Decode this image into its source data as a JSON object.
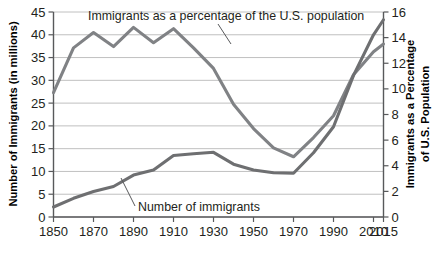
{
  "chart_data": {
    "type": "line",
    "title": "",
    "xlabel": "",
    "ylabel": "Number of Immigrants (in millions)",
    "y2label": "Immigrants as a Percentage of U.S. Population",
    "x": [
      1850,
      1860,
      1870,
      1880,
      1890,
      1900,
      1910,
      1920,
      1930,
      1940,
      1950,
      1960,
      1970,
      1980,
      1990,
      2000,
      2010,
      2015
    ],
    "xticks": [
      "1850",
      "1870",
      "1890",
      "1910",
      "1930",
      "1950",
      "1970",
      "1990",
      "2010",
      "2015"
    ],
    "xtick_values": [
      1850,
      1870,
      1890,
      1910,
      1930,
      1950,
      1970,
      1990,
      2010,
      2015
    ],
    "xlim": [
      1850,
      2015
    ],
    "yticks": [
      "0",
      "5",
      "10",
      "15",
      "20",
      "25",
      "30",
      "35",
      "40",
      "45"
    ],
    "ytick_values": [
      0,
      5,
      10,
      15,
      20,
      25,
      30,
      35,
      40,
      45
    ],
    "ylim": [
      0,
      45
    ],
    "y2ticks": [
      "0",
      "2",
      "4",
      "6",
      "8",
      "10",
      "12",
      "14",
      "16"
    ],
    "y2tick_values": [
      0,
      2,
      4,
      6,
      8,
      10,
      12,
      14,
      16
    ],
    "y2lim": [
      0,
      16
    ],
    "grid": true,
    "legend": "inline-annotations",
    "series": [
      {
        "name": "Number of immigrants",
        "axis": "left",
        "units": "millions",
        "color": "#6e6f71",
        "label_text": "Number of immigrants",
        "values": [
          2.2,
          4.1,
          5.6,
          6.7,
          9.2,
          10.3,
          13.5,
          13.9,
          14.2,
          11.6,
          10.3,
          9.7,
          9.6,
          14.1,
          19.8,
          31.1,
          40.0,
          43.3
        ]
      },
      {
        "name": "Immigrants as a percentage of the U.S. population",
        "axis": "right",
        "units": "percent",
        "color": "#808285",
        "label_text": "Immigrants as a percentage of the U.S. population",
        "values": [
          9.7,
          13.2,
          14.4,
          13.3,
          14.8,
          13.6,
          14.7,
          13.2,
          11.6,
          8.8,
          6.9,
          5.4,
          4.7,
          6.2,
          7.9,
          11.1,
          12.9,
          13.5
        ]
      }
    ]
  },
  "annotations": {
    "percentage_label": "Immigrants as a percentage of the U.S. population",
    "immigrants_label": "Number of immigrants"
  },
  "axes": {
    "left_title": "Number of Immigrants (in millions)",
    "right_title_line1": "Immigrants as a Percentage",
    "right_title_line2": "of U.S. Population"
  },
  "colors": {
    "grid": "#b9b9b9",
    "axis": "#58595b",
    "series_immigrants": "#6e6f71",
    "series_percentage": "#808285",
    "text": "#231f20",
    "background": "#ffffff"
  }
}
